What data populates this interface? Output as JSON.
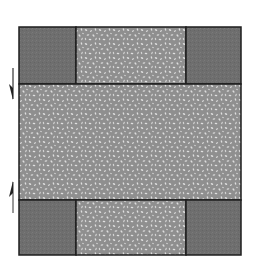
{
  "diagram": {
    "type": "quilt-block-layout",
    "colors": {
      "corner_fill": "#6d6d6d",
      "print_fill": "#8f8f8f",
      "print_speckle": "#d8d8d8",
      "border": "#1e1e1e",
      "arrow": "#333333"
    },
    "pieces": [
      {
        "id": "top-left-corner",
        "kind": "solid"
      },
      {
        "id": "top-center-strip",
        "kind": "print"
      },
      {
        "id": "top-right-corner",
        "kind": "solid"
      },
      {
        "id": "center-panel",
        "kind": "print"
      },
      {
        "id": "bottom-left-corner",
        "kind": "solid"
      },
      {
        "id": "bottom-center-strip",
        "kind": "print"
      },
      {
        "id": "bottom-right-corner",
        "kind": "solid"
      }
    ],
    "arrows": [
      {
        "id": "arrow-down",
        "direction": "down"
      },
      {
        "id": "arrow-up",
        "direction": "up"
      }
    ]
  }
}
